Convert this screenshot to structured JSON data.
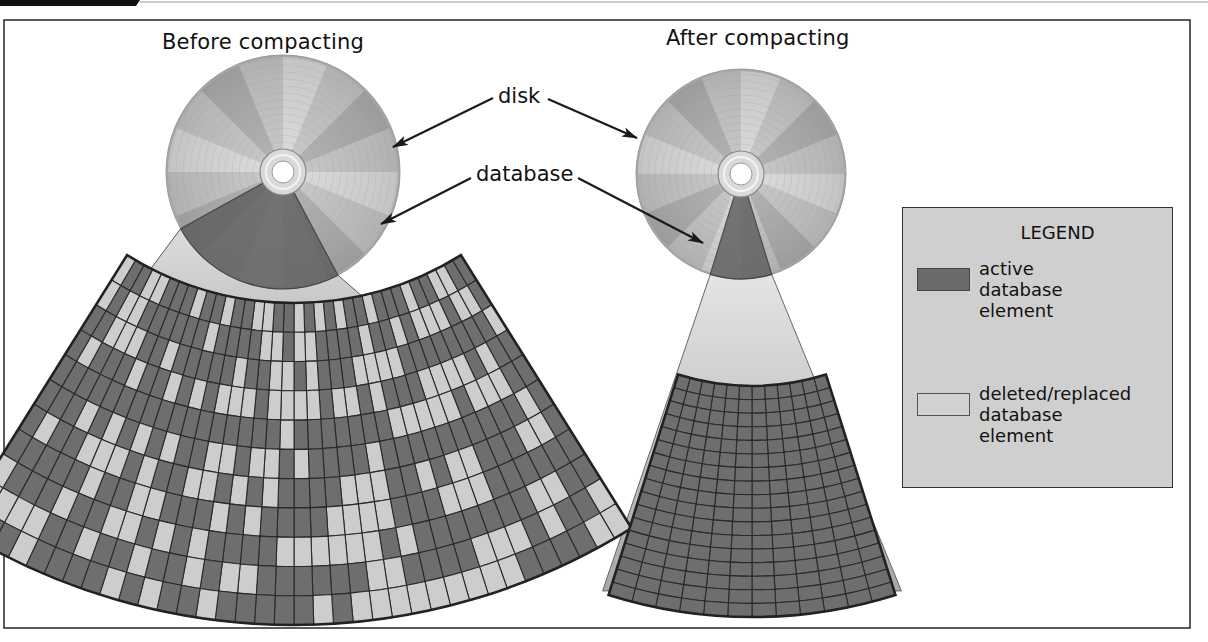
{
  "figure": {
    "before_title": "Before compacting",
    "after_title": "After compacting",
    "callouts": {
      "disk": "disk",
      "database": "database"
    }
  },
  "legend": {
    "title": "LEGEND",
    "items": [
      {
        "label_lines": [
          "active",
          "database",
          "element"
        ],
        "label": "active database element",
        "swatch_color": "#6b6b6b",
        "swatch_border": "#444444"
      },
      {
        "label_lines": [
          "deleted/replaced",
          "database",
          "element"
        ],
        "label": "deleted/replaced database element",
        "swatch_color": "#d2d2d2",
        "swatch_border": "#555555"
      }
    ]
  },
  "colors": {
    "active": "#6e6e6e",
    "deleted": "#cdcdcd",
    "grid_line": "#2a2a2a",
    "frame": "#333333",
    "legend_bg": "#cfcfcf",
    "cone": "#bdbdbd",
    "disk_base": "#b9b9b9"
  },
  "disks": {
    "before": {
      "cx": 283,
      "cy": 172,
      "r": 117,
      "db_start_deg": 62,
      "db_end_deg": 151
    },
    "after": {
      "cx": 741,
      "cy": 174,
      "r": 105,
      "db_start_deg": 73,
      "db_end_deg": 107
    }
  },
  "grids": {
    "before": {
      "cx": 294,
      "cy": -12,
      "r_inner": 315,
      "r_outer": 637,
      "a_start": 58,
      "a_end": 122,
      "rings": 11,
      "sectors": 36,
      "deleted_pattern_seed": 7
    },
    "after": {
      "cx": 752,
      "cy": 140,
      "r_inner": 246,
      "r_outer": 477,
      "a_start": 72.5,
      "a_end": 107.5,
      "rings": 17,
      "sectors": 12
    }
  }
}
